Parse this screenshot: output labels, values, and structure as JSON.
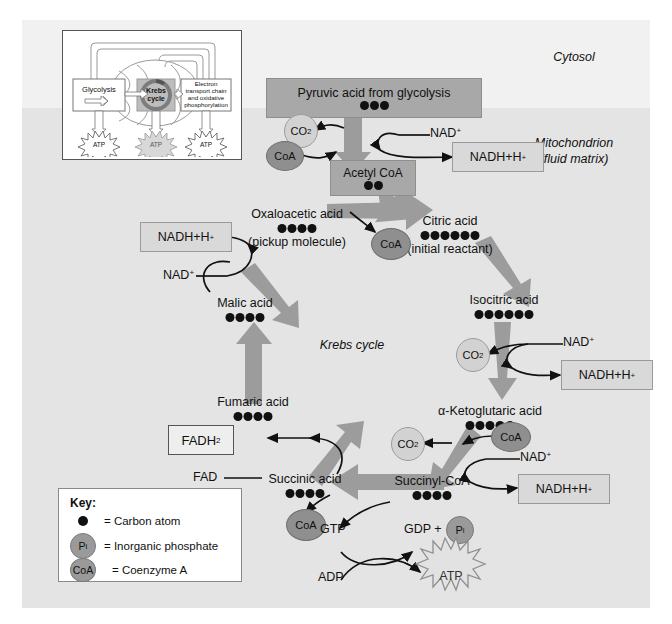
{
  "regions": {
    "cytosol": "Cytosol",
    "mitochondrion_line1": "Mitochondrion",
    "mitochondrion_line2": "(fluid matrix)",
    "cycle_label": "Krebs cycle"
  },
  "inset": {
    "glycolysis": "Glycolysis",
    "krebs_line1": "Krebs",
    "krebs_line2": "cycle",
    "etc_line1": "Electron",
    "etc_line2": "transport chain",
    "etc_line3": "and oxidative",
    "etc_line4": "phosphorylation",
    "atp": "ATP"
  },
  "molecules": {
    "pyruvic": {
      "label": "Pyruvic acid from glycolysis",
      "carbons": 3
    },
    "acetyl_coa": {
      "label": "Acetyl CoA",
      "carbons": 2
    },
    "citric": {
      "label": "Citric acid",
      "sublabel": "(initial reactant)",
      "carbons": 6
    },
    "isocitric": {
      "label": "Isocitric acid",
      "carbons": 6
    },
    "ketoglutaric": {
      "label": "α-Ketoglutaric acid",
      "carbons": 5
    },
    "succinyl_coa": {
      "label": "Succinyl-CoA",
      "carbons": 4
    },
    "succinic": {
      "label": "Succinic acid",
      "carbons": 4
    },
    "fumaric": {
      "label": "Fumaric acid",
      "carbons": 4
    },
    "malic": {
      "label": "Malic acid",
      "carbons": 4
    },
    "oxaloacetic": {
      "label": "Oxaloacetic acid",
      "sublabel": "(pickup molecule)",
      "carbons": 4
    }
  },
  "cofactors": {
    "nad_plus": "NAD",
    "nad_charge": "+",
    "nadh": "NADH+H",
    "nadh_charge": "+",
    "fad": "FAD",
    "fadh2_base": "FADH",
    "fadh2_sub": "2",
    "co2_base": "CO",
    "co2_sub": "2",
    "coa": "CoA",
    "gtp": "GTP",
    "gdp": "GDP +",
    "pi": "P",
    "pi_sub": "i",
    "adp": "ADP",
    "atp": "ATP"
  },
  "key": {
    "title": "Key:",
    "items": [
      {
        "glyph": "carbon-dot",
        "text": "= Carbon atom"
      },
      {
        "glyph": "pi-token",
        "text": "= Inorganic phosphate"
      },
      {
        "glyph": "coa-token",
        "text": "= Coenzyme A"
      }
    ]
  },
  "colors": {
    "canvas": "#eeeeee",
    "cytosol": "#f1f1f1",
    "mitochondrion": "#e4e4e4",
    "box_gray": "#a8a8a8",
    "box_light": "#d9d9d9",
    "arrow_gray": "#9c9c9c",
    "carbon": "#111111"
  }
}
